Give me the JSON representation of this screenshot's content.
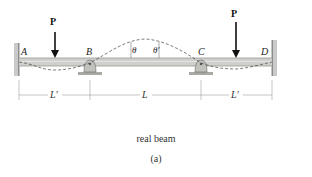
{
  "diagram": {
    "labels": {
      "load_left": "P",
      "load_right": "P",
      "point_a": "A",
      "point_b": "B",
      "point_c": "C",
      "point_d": "D",
      "theta_left": "θ",
      "theta_right": "θ′"
    },
    "dimensions": {
      "span_ab": "L′",
      "span_bc": "L",
      "span_cd": "L′"
    },
    "caption": "real beam",
    "sublabel": "(a)",
    "colors": {
      "beam": "#c8c8c4",
      "beam_edge": "#8a8a86",
      "wall": "#b5b5b5",
      "support": "#bdbdb8",
      "line": "#333333",
      "dim": "#777777"
    }
  }
}
